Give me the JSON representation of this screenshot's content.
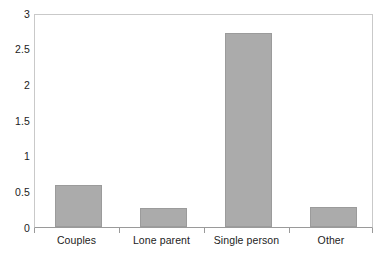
{
  "chart_data": {
    "type": "bar",
    "title": "",
    "subtitle": "",
    "xlabel": "",
    "ylabel": "",
    "categories": [
      "Couples",
      "Lone parent",
      "Single person",
      "Other"
    ],
    "values": [
      0.6,
      0.27,
      2.74,
      0.28
    ],
    "series": [
      {
        "name": "",
        "values": [
          0.6,
          0.27,
          2.74,
          0.28
        ]
      }
    ],
    "ylim": [
      0,
      3
    ],
    "ytick_labels": [
      "0",
      "0.5",
      "1",
      "1.5",
      "2",
      "2.5",
      "3"
    ],
    "ytick_values": [
      0,
      0.5,
      1,
      1.5,
      2,
      2.5,
      3
    ],
    "grid": false,
    "legend": null,
    "legend_position": "none",
    "annotations": [],
    "bar_color": "#ababab",
    "bar_border_color": "#9b9b9b",
    "axis_color": "#9a9a9a",
    "frame_color": "#c9c9c9",
    "background_color": "#ffffff",
    "text_color": "#1c1c1c"
  }
}
